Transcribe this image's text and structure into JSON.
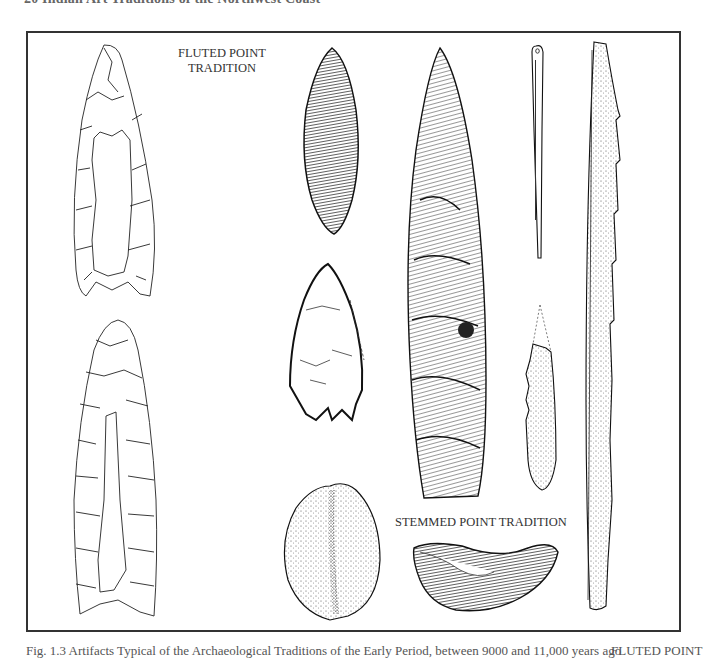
{
  "page": {
    "running_head": "20  Indian Art Traditions of the Northwest Coast",
    "caption": "Fig. 1.3   Artifacts Typical of the Archaeological Traditions of the Early Period, between 9000 and 11,000 years ago",
    "caption_tag": "FLUTED POINT"
  },
  "figure": {
    "labels": {
      "fluted_line1": "FLUTED POINT",
      "fluted_line2": "TRADITION",
      "stemmed": "STEMMED POINT TRADITION"
    },
    "artifacts": [
      {
        "id": "fluted-point-1",
        "style": "outline",
        "tradition": "Fluted Point"
      },
      {
        "id": "fluted-point-2",
        "style": "outline",
        "tradition": "Fluted Point"
      },
      {
        "id": "leaf-point-dark",
        "style": "hatched"
      },
      {
        "id": "notched-point",
        "style": "hatched"
      },
      {
        "id": "cobble-tool",
        "style": "stippled"
      },
      {
        "id": "long-lanceolate-point",
        "style": "hatched"
      },
      {
        "id": "eyed-needle",
        "style": "line"
      },
      {
        "id": "barbed-fragment",
        "style": "stippled"
      },
      {
        "id": "crescent",
        "style": "hatched",
        "tradition": "Stemmed Point"
      },
      {
        "id": "barbed-harpoon",
        "style": "stippled"
      }
    ]
  },
  "colors": {
    "ink": "#1a1a1a",
    "frame": "#333333",
    "paper": "#ffffff"
  }
}
